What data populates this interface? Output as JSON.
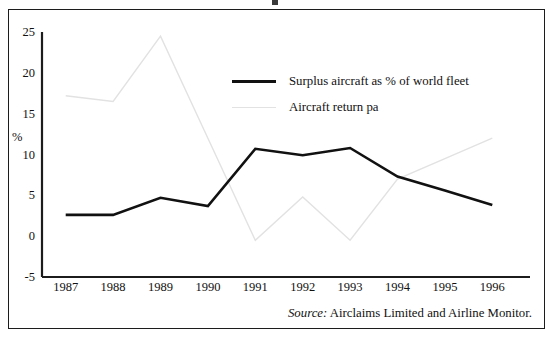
{
  "figure": {
    "source_prefix": "Source:",
    "source_text": "Airclaims Limited and Airline Monitor."
  },
  "legend": {
    "items": [
      {
        "label": "Surplus aircraft as % of world fleet",
        "color": "#111111",
        "style": "thick-solid"
      },
      {
        "label": "Aircraft return pa",
        "color": "#e2e2e2",
        "style": "thin-faint"
      }
    ]
  },
  "chart_data": {
    "type": "line",
    "title": "",
    "xlabel": "",
    "ylabel": "%",
    "categories": [
      "1987",
      "1988",
      "1989",
      "1990",
      "1991",
      "1992",
      "1993",
      "1994",
      "1995",
      "1996"
    ],
    "ylim": [
      -5,
      25
    ],
    "yticks": [
      25,
      20,
      15,
      10,
      5,
      0,
      -5
    ],
    "ytick_labels": [
      "25",
      "20",
      "15",
      "10",
      "5",
      "0",
      "-5"
    ],
    "grid": false,
    "legend_position": "inside-upper-right",
    "series": [
      {
        "name": "Surplus aircraft as % of world fleet",
        "color": "#111111",
        "linewidth": 2.6,
        "values": [
          2.6,
          2.6,
          4.7,
          3.7,
          10.7,
          9.9,
          10.8,
          7.3,
          5.6,
          3.8
        ]
      },
      {
        "name": "Aircraft return pa",
        "color": "#e2e2e2",
        "linewidth": 1.4,
        "values": [
          17.2,
          16.5,
          24.5,
          12.0,
          -0.5,
          4.8,
          -0.5,
          7.0,
          9.5,
          12.0
        ]
      }
    ]
  },
  "axis_geometry": {
    "plot_left": 42,
    "plot_right": 516,
    "y_top_px": 32,
    "y_bottom_px": 277
  }
}
